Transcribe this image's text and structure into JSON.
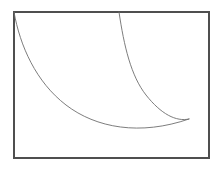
{
  "figure": {
    "title": "",
    "caption": "",
    "background_color": "#ffffff",
    "frame": {
      "name": "rectangular-plot-border",
      "x": 13,
      "y": 11,
      "width": 197,
      "height": 148,
      "stroke_color": "#4f4f4f",
      "stroke_width": 2
    },
    "curve_style": {
      "stroke_color": "#6e6e6e",
      "stroke_width": 0.9,
      "fill": "none"
    },
    "shape_description": "crescent-lune bounded by two concave curves",
    "curves": [
      {
        "name": "outer-left-curve",
        "start": [
          14,
          12
        ],
        "end": [
          189,
          119
        ],
        "path": "M 14 12 C 20 46, 36 82, 66 105 C 96 128, 140 136, 189 119"
      },
      {
        "name": "inner-right-curve",
        "start": [
          119,
          12
        ],
        "end": [
          189,
          119
        ],
        "path": "M 119 12 C 124 46, 131 76, 146 95 C 161 114, 176 122, 189 119"
      }
    ],
    "vertices": [
      {
        "name": "top-left-origin",
        "x": 14,
        "y": 12
      },
      {
        "name": "top-inner-origin",
        "x": 119,
        "y": 12
      },
      {
        "name": "cusp-tip",
        "x": 189,
        "y": 119
      },
      {
        "name": "lowest-point",
        "x": 130,
        "y": 130
      }
    ]
  }
}
